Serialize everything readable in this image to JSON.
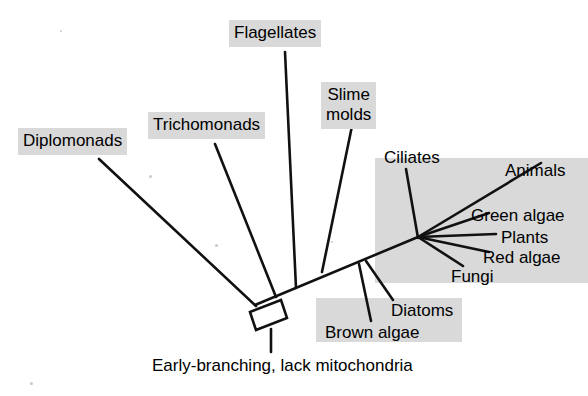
{
  "figure": {
    "type": "phylogenetic-tree",
    "title": "",
    "caption": "Early-branching, lack mitochondria",
    "background_color": "#ffffff",
    "line_color": "#000000",
    "label_background_color": "#d9d9d9",
    "text_color": "#000000"
  },
  "shaded_groups": [
    {
      "name": "crown-eukaryotes-shade",
      "x": 375,
      "y": 158,
      "width": 213,
      "height": 125
    },
    {
      "name": "stramenopiles-shade",
      "x": 316,
      "y": 298,
      "width": 146,
      "height": 44
    }
  ],
  "labels": [
    {
      "name": "diplomonads",
      "text": "Diplomonads",
      "x": 18,
      "y": 128,
      "shaded": true,
      "align": "left"
    },
    {
      "name": "trichomonads",
      "text": "Trichomonads",
      "x": 148,
      "y": 112,
      "shaded": true,
      "align": "left"
    },
    {
      "name": "flagellates",
      "text": "Flagellates",
      "x": 229,
      "y": 20,
      "shaded": true,
      "align": "left"
    },
    {
      "name": "slime-molds",
      "text": "Slime\nmolds",
      "x": 321,
      "y": 82,
      "shaded": true,
      "align": "center"
    },
    {
      "name": "ciliates",
      "text": "Ciliates",
      "x": 379,
      "y": 145,
      "shaded": false,
      "align": "left"
    },
    {
      "name": "animals",
      "text": "Animals",
      "x": 500,
      "y": 158,
      "shaded": false,
      "align": "left"
    },
    {
      "name": "green-algae",
      "text": "Green algae",
      "x": 466,
      "y": 203,
      "shaded": false,
      "align": "left"
    },
    {
      "name": "plants",
      "text": "Plants",
      "x": 496,
      "y": 225,
      "shaded": false,
      "align": "left"
    },
    {
      "name": "red-algae",
      "text": "Red algae",
      "x": 478,
      "y": 245,
      "shaded": false,
      "align": "left"
    },
    {
      "name": "fungi",
      "text": "Fungi",
      "x": 446,
      "y": 264,
      "shaded": false,
      "align": "left"
    },
    {
      "name": "diatoms",
      "text": "Diatoms",
      "x": 386,
      "y": 298,
      "shaded": false,
      "align": "left"
    },
    {
      "name": "brown-algae",
      "text": "Brown algae",
      "x": 320,
      "y": 320,
      "shaded": false,
      "align": "left"
    }
  ],
  "caption_position": {
    "x": 152,
    "y": 356
  },
  "branches": [
    {
      "name": "trunk",
      "x1": 255,
      "y1": 305,
      "x2": 418,
      "y2": 237
    },
    {
      "name": "diplomonads-branch",
      "x1": 99,
      "y1": 159,
      "x2": 256,
      "y2": 306
    },
    {
      "name": "trichomonads-branch",
      "x1": 215,
      "y1": 144,
      "x2": 276,
      "y2": 297
    },
    {
      "name": "flagellates-branch",
      "x1": 285,
      "y1": 52,
      "x2": 296,
      "y2": 288
    },
    {
      "name": "slime-molds-branch",
      "x1": 352,
      "y1": 126,
      "x2": 322,
      "y2": 272
    },
    {
      "name": "ciliates-branch",
      "x1": 406,
      "y1": 169,
      "x2": 418,
      "y2": 238
    },
    {
      "name": "animals-branch",
      "x1": 418,
      "y1": 237,
      "x2": 541,
      "y2": 163
    },
    {
      "name": "green-algae-branch",
      "x1": 418,
      "y1": 237,
      "x2": 489,
      "y2": 213
    },
    {
      "name": "plants-branch",
      "x1": 418,
      "y1": 237,
      "x2": 496,
      "y2": 234
    },
    {
      "name": "red-algae-branch",
      "x1": 418,
      "y1": 237,
      "x2": 489,
      "y2": 252
    },
    {
      "name": "fungi-branch",
      "x1": 418,
      "y1": 237,
      "x2": 463,
      "y2": 266
    },
    {
      "name": "diatoms-branch",
      "x1": 366,
      "y1": 261,
      "x2": 393,
      "y2": 300
    },
    {
      "name": "brown-algae-branch",
      "x1": 359,
      "y1": 264,
      "x2": 371,
      "y2": 321
    },
    {
      "name": "root-stem",
      "x1": 271,
      "y1": 329,
      "x2": 271,
      "y2": 352
    }
  ],
  "root_box": {
    "name": "root-node-box",
    "points": "250,312 281,300 287,318 256,330"
  }
}
